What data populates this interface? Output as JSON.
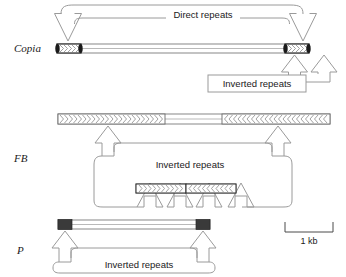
{
  "figure": {
    "scale": {
      "label": "1 kb",
      "bar_width_px": 48
    },
    "elements": [
      {
        "id": "copia",
        "label": "Copia",
        "label_style": "italic",
        "annotations": [
          {
            "id": "direct-repeats",
            "label": "Direct repeats"
          },
          {
            "id": "inverted-repeats",
            "label": "Inverted repeats"
          }
        ],
        "body": {
          "x": 57,
          "y": 44,
          "width": 252,
          "height": 9,
          "repeat_blocks": [
            {
              "side": "left",
              "x": 57,
              "width": 24,
              "chevron_direction": "right"
            },
            {
              "side": "right",
              "x": 285,
              "width": 24,
              "chevron_direction": "right"
            }
          ]
        }
      },
      {
        "id": "fb",
        "label": "FB",
        "label_style": "italic",
        "annotations": [
          {
            "id": "inverted-repeats",
            "label": "Inverted repeats"
          }
        ],
        "body": {
          "x": 58,
          "y": 114,
          "width": 272,
          "height": 10,
          "repeat_blocks": [
            {
              "side": "left",
              "x": 58,
              "width": 107,
              "chevron_direction": "right"
            },
            {
              "side": "right",
              "x": 222,
              "width": 108,
              "chevron_direction": "left"
            }
          ]
        },
        "derivative": {
          "x": 136,
          "y": 184,
          "width": 100,
          "height": 9,
          "repeat_blocks": [
            {
              "side": "left",
              "x": 136,
              "width": 50,
              "chevron_direction": "right"
            },
            {
              "side": "right",
              "x": 186,
              "width": 50,
              "chevron_direction": "left"
            }
          ]
        }
      },
      {
        "id": "p",
        "label": "P",
        "label_style": "italic",
        "annotations": [
          {
            "id": "inverted-repeats",
            "label": "Inverted repeats"
          }
        ],
        "body": {
          "x": 58,
          "y": 220,
          "width": 152,
          "height": 9,
          "repeat_blocks": [
            {
              "side": "left",
              "x": 58,
              "width": 14,
              "style": "solid-black"
            },
            {
              "side": "right",
              "x": 196,
              "width": 14,
              "style": "solid-black"
            }
          ]
        }
      }
    ]
  },
  "colors": {
    "background": "#ffffff",
    "arrow_stroke": "#9a9a9a",
    "bar_stroke": "#7a7a7a",
    "bar_fill": "#ffffff",
    "block_dark": "#3a3a3a",
    "text": "#1a1a1a",
    "scale_stroke": "#4a4a4a"
  }
}
